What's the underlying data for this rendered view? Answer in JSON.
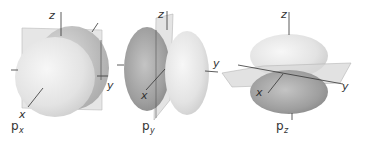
{
  "figure": {
    "orbitals": [
      {
        "id": "px",
        "caption_main": "p",
        "caption_sub": "x",
        "axes": {
          "x": "x",
          "y": "y",
          "z": "z"
        },
        "lobe_orientation": "along x axis (toward/away from viewer)"
      },
      {
        "id": "py",
        "caption_main": "p",
        "caption_sub": "y",
        "axes": {
          "x": "x",
          "y": "y",
          "z": "z"
        },
        "lobe_orientation": "along y axis (left-right)"
      },
      {
        "id": "pz",
        "caption_main": "p",
        "caption_sub": "z",
        "axes": {
          "x": "x",
          "y": "y",
          "z": "z"
        },
        "lobe_orientation": "along z axis (up-down)"
      }
    ],
    "colors": {
      "light_lobe": "#e6e6e6",
      "dark_lobe": "#9a9a9a",
      "plane": "#d8d8d8",
      "axis": "#333333"
    }
  }
}
